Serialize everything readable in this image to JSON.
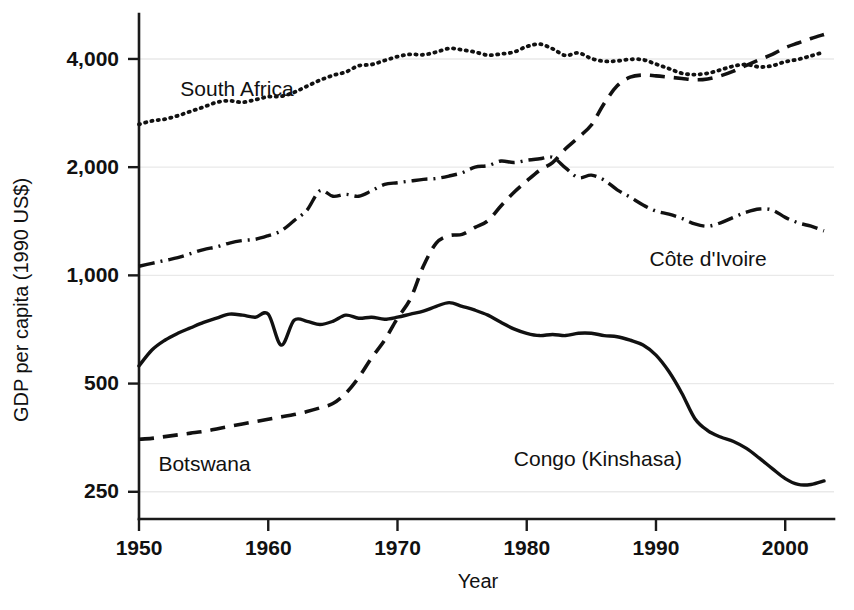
{
  "chart_data": {
    "type": "line",
    "title": "",
    "subtitle": "",
    "xlabel": "Year",
    "ylabel": "GDP per capita (1990 US$)",
    "yscale": "log",
    "xlim": [
      1950,
      2003
    ],
    "ylim": [
      210,
      5200
    ],
    "grid": true,
    "legend_position": "inline-annotations",
    "xticks": [
      1950,
      1960,
      1970,
      1980,
      1990,
      2000
    ],
    "xtick_labels": [
      "1950",
      "1960",
      "1970",
      "1980",
      "1990",
      "2000"
    ],
    "yticks": [
      250,
      500,
      1000,
      2000,
      4000
    ],
    "ytick_labels": [
      "250",
      "500",
      "1,000",
      "2,000",
      "4,000"
    ],
    "x": [
      1950,
      1951,
      1952,
      1953,
      1954,
      1955,
      1956,
      1957,
      1958,
      1959,
      1960,
      1961,
      1962,
      1963,
      1964,
      1965,
      1966,
      1967,
      1968,
      1969,
      1970,
      1971,
      1972,
      1973,
      1974,
      1975,
      1976,
      1977,
      1978,
      1979,
      1980,
      1981,
      1982,
      1983,
      1984,
      1985,
      1986,
      1987,
      1988,
      1989,
      1990,
      1991,
      1992,
      1993,
      1994,
      1995,
      1996,
      1997,
      1998,
      1999,
      2000,
      2001,
      2002,
      2003
    ],
    "series": [
      {
        "name": "South Africa",
        "style": "dotted",
        "label_x": 1953.2,
        "label_y": 3150,
        "values": [
          2630,
          2690,
          2720,
          2780,
          2860,
          2940,
          3030,
          3060,
          3030,
          3080,
          3140,
          3150,
          3230,
          3360,
          3490,
          3600,
          3680,
          3830,
          3860,
          3960,
          4060,
          4120,
          4110,
          4180,
          4280,
          4240,
          4180,
          4100,
          4130,
          4180,
          4330,
          4400,
          4270,
          4090,
          4160,
          4010,
          3940,
          3950,
          3990,
          3980,
          3870,
          3760,
          3650,
          3620,
          3650,
          3730,
          3820,
          3860,
          3800,
          3830,
          3930,
          3990,
          4080,
          4180
        ]
      },
      {
        "name": "Botswana",
        "style": "dashed",
        "label_x": 1951.5,
        "label_y": 285,
        "values": [
          350,
          352,
          356,
          360,
          364,
          368,
          374,
          380,
          386,
          392,
          398,
          404,
          410,
          418,
          428,
          440,
          470,
          520,
          590,
          660,
          760,
          860,
          1060,
          1230,
          1290,
          1300,
          1360,
          1420,
          1560,
          1700,
          1830,
          1960,
          2060,
          2250,
          2420,
          2620,
          3010,
          3370,
          3560,
          3610,
          3590,
          3560,
          3530,
          3500,
          3520,
          3590,
          3700,
          3840,
          3980,
          4120,
          4300,
          4430,
          4560,
          4680
        ]
      },
      {
        "name": "Côte d'Ivoire",
        "style": "dashdot",
        "label_x": 1989.5,
        "label_y": 1060,
        "values": [
          1060,
          1080,
          1100,
          1120,
          1150,
          1180,
          1200,
          1230,
          1250,
          1260,
          1290,
          1330,
          1420,
          1520,
          1720,
          1660,
          1680,
          1660,
          1720,
          1790,
          1810,
          1830,
          1850,
          1860,
          1890,
          1930,
          2000,
          2020,
          2080,
          2060,
          2090,
          2110,
          2130,
          1990,
          1870,
          1900,
          1840,
          1730,
          1650,
          1570,
          1510,
          1480,
          1440,
          1390,
          1370,
          1400,
          1450,
          1500,
          1530,
          1520,
          1450,
          1400,
          1370,
          1330
        ]
      },
      {
        "name": "Congo (Kinshasa)",
        "style": "solid",
        "label_x": 1979.0,
        "label_y": 295,
        "values": [
          560,
          620,
          660,
          690,
          715,
          740,
          760,
          780,
          775,
          765,
          780,
          640,
          750,
          745,
          730,
          745,
          775,
          760,
          765,
          755,
          765,
          780,
          795,
          820,
          840,
          820,
          800,
          775,
          740,
          710,
          690,
          680,
          685,
          680,
          690,
          690,
          680,
          675,
          660,
          640,
          600,
          540,
          470,
          400,
          370,
          355,
          345,
          330,
          310,
          290,
          272,
          262,
          262,
          268
        ]
      }
    ]
  }
}
